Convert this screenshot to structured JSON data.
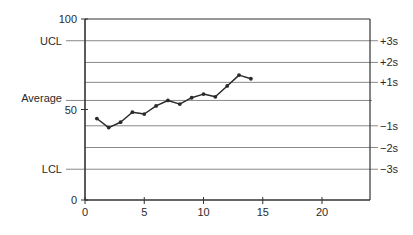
{
  "chart_data": {
    "type": "line",
    "title": "",
    "xlabel": "",
    "ylabel": "",
    "xlim": [
      0,
      24
    ],
    "ylim": [
      0,
      100
    ],
    "x_ticks": [
      0,
      5,
      10,
      15,
      20
    ],
    "y_ticks": [
      0,
      50,
      100
    ],
    "grid": false,
    "legend": null,
    "series": [
      {
        "name": "Measurements",
        "x": [
          1,
          2,
          3,
          4,
          5,
          6,
          7,
          8,
          9,
          10,
          11,
          12,
          13,
          14
        ],
        "values": [
          45,
          40,
          43,
          48.5,
          47.5,
          52,
          55,
          53,
          56.5,
          58.5,
          57,
          63,
          69,
          67
        ]
      }
    ],
    "reference_lines": [
      {
        "name": "UCL",
        "value": 88,
        "left_label": "UCL",
        "right_label": "+3s"
      },
      {
        "name": "+2s",
        "value": 76,
        "left_label": "",
        "right_label": "+2s"
      },
      {
        "name": "+1s",
        "value": 65,
        "left_label": "",
        "right_label": "+1s"
      },
      {
        "name": "Average",
        "value": 55,
        "left_label": "Average",
        "right_label": ""
      },
      {
        "name": "-1s",
        "value": 41,
        "left_label": "",
        "right_label": "−1s"
      },
      {
        "name": "-2s",
        "value": 29,
        "left_label": "",
        "right_label": "−2s"
      },
      {
        "name": "LCL",
        "value": 17,
        "left_label": "LCL",
        "right_label": "−3s"
      }
    ]
  },
  "colors": {
    "line": "#2a2a2a",
    "reference": "#8a8a8a",
    "axis": "#333333"
  }
}
